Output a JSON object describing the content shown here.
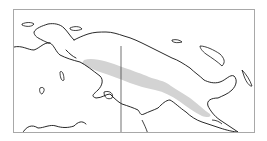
{
  "map": {
    "region": "New Guinea",
    "subject": "Species distribution range",
    "legend": {
      "range_fill_color": "#d3d3d3",
      "coastline_color": "#111111",
      "frame_color": "#a8a8a8"
    },
    "features": [
      {
        "name": "distribution-range",
        "type": "shaded-area"
      },
      {
        "name": "international-border",
        "type": "line"
      },
      {
        "name": "coastline",
        "type": "outline"
      }
    ]
  }
}
